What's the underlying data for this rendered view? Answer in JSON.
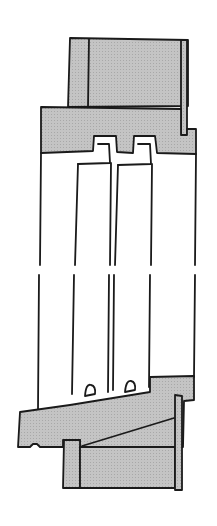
{
  "figure": {
    "type": "architectural-section-drawing",
    "has_text": false,
    "colors": {
      "background": "#ffffff",
      "hatch_fill": "#bdbdbd",
      "stroke": "#1a1a1a"
    },
    "parts": [
      {
        "name": "upper-wall",
        "fill": "hatch"
      },
      {
        "name": "window-head",
        "fill": "hatch"
      },
      {
        "name": "outer-sash",
        "fill": "none"
      },
      {
        "name": "inner-sash",
        "fill": "none"
      },
      {
        "name": "break-gap",
        "fill": "none"
      },
      {
        "name": "window-sill",
        "fill": "hatch"
      },
      {
        "name": "lower-wall",
        "fill": "hatch"
      }
    ]
  }
}
